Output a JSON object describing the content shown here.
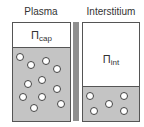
{
  "left_compartment": {
    "title": "Plasma",
    "pressure_symbol": "Π",
    "pressure_subscript": "cap",
    "particles": [
      [
        20,
        57
      ],
      [
        31,
        65
      ],
      [
        46,
        61
      ],
      [
        57,
        69
      ],
      [
        28,
        84
      ],
      [
        42,
        80
      ],
      [
        57,
        89
      ],
      [
        23,
        97
      ],
      [
        42,
        97
      ],
      [
        61,
        104
      ],
      [
        34,
        108
      ]
    ]
  },
  "right_compartment": {
    "title": "Interstitium",
    "pressure_symbol": "Π",
    "pressure_subscript": "int",
    "particles": [
      [
        90,
        96
      ],
      [
        124,
        96
      ],
      [
        109,
        104
      ],
      [
        94,
        111
      ],
      [
        124,
        111
      ]
    ]
  },
  "colors": {
    "fluid": "#c4c4c4",
    "membrane": "#8f8f8f",
    "outline": "#555555"
  }
}
